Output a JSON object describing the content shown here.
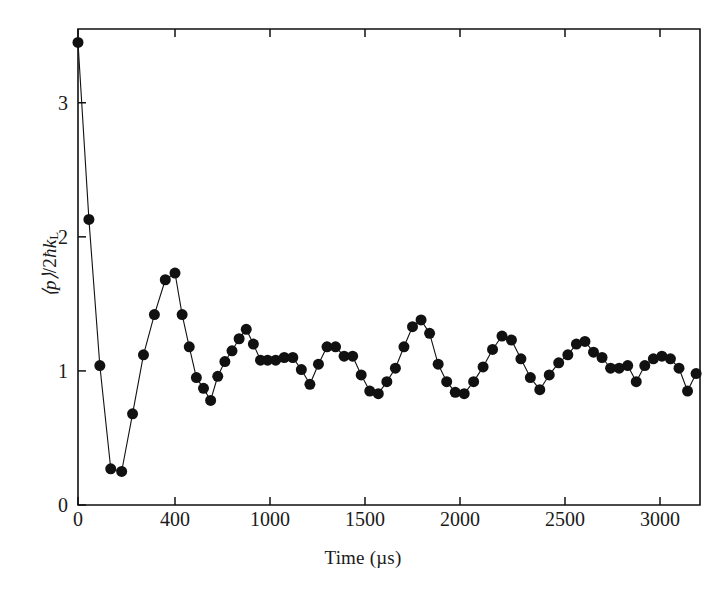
{
  "figure": {
    "xlabel": "Time (µs)",
    "ylabel_html": "⟨p⟩/2ℏk_L",
    "background": "#ffffff",
    "ink_color": "#111111"
  },
  "chart_data": {
    "type": "line",
    "title": "",
    "subtitle": "",
    "xlabel": "Time (µs)",
    "ylabel": "⟨p⟩/2ħk_L",
    "xlim": [
      0,
      3200
    ],
    "ylim": [
      0,
      3.55
    ],
    "grid": false,
    "legend": null,
    "marker": "filled-circle",
    "marker_size_px": 11,
    "line_width_px": 1.1,
    "series_color": "#111111",
    "xticks": [
      0,
      400,
      1000,
      1500,
      2000,
      2500,
      3000
    ],
    "xtick_labels": [
      "0",
      "400",
      "1000",
      "1500",
      "2000",
      "2500",
      "3000"
    ],
    "xtick_pixels": [
      78,
      175,
      270,
      365,
      460,
      565,
      660
    ],
    "yticks": [
      0,
      1,
      2,
      3
    ],
    "ytick_labels": [
      "0",
      "1",
      "2",
      "3"
    ],
    "x": [
      0,
      45,
      90,
      135,
      180,
      225,
      270,
      315,
      360,
      400,
      445,
      490,
      535,
      580,
      625,
      670,
      715,
      760,
      805,
      850,
      895,
      940,
      985,
      1030,
      1075,
      1120,
      1165,
      1210,
      1255,
      1300,
      1345,
      1390,
      1435,
      1480,
      1525,
      1570,
      1615,
      1660,
      1705,
      1750,
      1795,
      1840,
      1885,
      1930,
      1975,
      2020,
      2065,
      2110,
      2155,
      2200,
      2245,
      2290,
      2335,
      2380,
      2425,
      2470,
      2515,
      2560,
      2605,
      2650,
      2695,
      2740,
      2785,
      2830,
      2875,
      2920,
      2965,
      3010,
      3055,
      3100,
      3145,
      3190
    ],
    "y": [
      3.45,
      2.13,
      1.04,
      0.27,
      0.25,
      0.68,
      1.12,
      1.42,
      1.68,
      1.73,
      1.42,
      1.18,
      0.95,
      0.87,
      0.78,
      0.96,
      1.07,
      1.15,
      1.24,
      1.31,
      1.2,
      1.08,
      1.08,
      1.08,
      1.1,
      1.1,
      1.01,
      0.9,
      1.05,
      1.18,
      1.18,
      1.11,
      1.11,
      0.97,
      0.85,
      0.83,
      0.92,
      1.02,
      1.18,
      1.33,
      1.38,
      1.28,
      1.05,
      0.92,
      0.84,
      0.83,
      0.92,
      1.03,
      1.16,
      1.26,
      1.23,
      1.09,
      0.95,
      0.86,
      0.97,
      1.06,
      1.12,
      1.2,
      1.22,
      1.14,
      1.1,
      1.02,
      1.02,
      1.04,
      0.92,
      1.04,
      1.09,
      1.11,
      1.09,
      1.02,
      0.85,
      0.98
    ]
  }
}
